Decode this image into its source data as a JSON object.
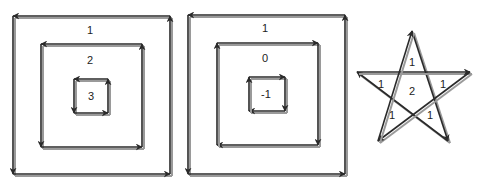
{
  "colors": {
    "line_dark": "#2a2a2a",
    "line_light": "#9a9a9a",
    "background": "#ffffff"
  },
  "diagrams": [
    {
      "id": "nested-squares-same-orientation",
      "description": "Three nested counter-clockwise squares",
      "squares": [
        {
          "x1": 13,
          "y1": 16,
          "x2": 170,
          "y2": 174,
          "direction": "ccw",
          "label": "1",
          "label_x": 90,
          "label_y": 30
        },
        {
          "x1": 41,
          "y1": 44,
          "x2": 142,
          "y2": 147,
          "direction": "ccw",
          "label": "2",
          "label_x": 90,
          "label_y": 60
        },
        {
          "x1": 74,
          "y1": 79,
          "x2": 108,
          "y2": 113,
          "direction": "ccw",
          "label": "3",
          "label_x": 91,
          "label_y": 96
        }
      ]
    },
    {
      "id": "nested-squares-mixed-orientation",
      "description": "Outer counter-clockwise, inner two clockwise",
      "squares": [
        {
          "x1": 188,
          "y1": 15,
          "x2": 345,
          "y2": 174,
          "direction": "ccw",
          "label": "1",
          "label_x": 265,
          "label_y": 28
        },
        {
          "x1": 217,
          "y1": 43,
          "x2": 318,
          "y2": 145,
          "direction": "cw",
          "label": "0",
          "label_x": 265,
          "label_y": 58
        },
        {
          "x1": 249,
          "y1": 77,
          "x2": 285,
          "y2": 111,
          "direction": "cw",
          "label": "-1",
          "label_x": 266,
          "label_y": 94
        }
      ]
    },
    {
      "id": "pentagram",
      "description": "Self-intersecting star polygon with winding numbers",
      "points": [
        [
          412,
          31
        ],
        [
          448,
          141
        ],
        [
          357,
          72
        ],
        [
          470,
          72
        ],
        [
          378,
          141
        ]
      ],
      "labels": [
        {
          "text": "1",
          "x": 412,
          "y": 62
        },
        {
          "text": "1",
          "x": 381,
          "y": 84
        },
        {
          "text": "1",
          "x": 443,
          "y": 84
        },
        {
          "text": "2",
          "x": 412,
          "y": 91
        },
        {
          "text": "1",
          "x": 392,
          "y": 115
        },
        {
          "text": "1",
          "x": 430,
          "y": 115
        }
      ]
    }
  ]
}
